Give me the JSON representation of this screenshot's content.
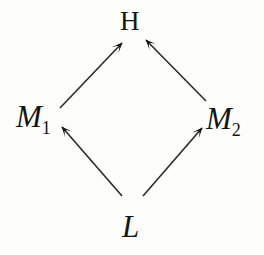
{
  "diagram": {
    "type": "lattice-hasse-diagram",
    "title": "",
    "background_color": "#fdfdfc",
    "ink_color": "#151515",
    "nodes": [
      {
        "id": "H",
        "base": "H",
        "subscript": "",
        "style": "upright",
        "x": 131,
        "y": 22,
        "role": "top"
      },
      {
        "id": "M1",
        "base": "M",
        "subscript": "1",
        "style": "italic",
        "x": 38,
        "y": 117,
        "role": "middle-left"
      },
      {
        "id": "M2",
        "base": "M",
        "subscript": "2",
        "style": "italic",
        "x": 228,
        "y": 119,
        "role": "middle-right"
      },
      {
        "id": "L",
        "base": "L",
        "subscript": "",
        "style": "italic",
        "x": 134,
        "y": 226,
        "role": "bottom"
      }
    ],
    "edges": [
      {
        "id": "m1-to-h",
        "from": "M1",
        "to": "H",
        "direction": "up-right",
        "x1": 60,
        "y1": 108,
        "x2": 122,
        "y2": 43
      },
      {
        "id": "m2-to-h",
        "from": "M2",
        "to": "H",
        "direction": "up-left",
        "x1": 206,
        "y1": 101,
        "x2": 146,
        "y2": 40
      },
      {
        "id": "l-to-m1",
        "from": "L",
        "to": "M1",
        "direction": "up-left",
        "x1": 122,
        "y1": 196,
        "x2": 62,
        "y2": 127
      },
      {
        "id": "l-to-m2",
        "from": "L",
        "to": "M2",
        "direction": "up-right",
        "x1": 143,
        "y1": 196,
        "x2": 202,
        "y2": 128
      }
    ],
    "arrowhead_style": "tex-barbed",
    "line_width": 1.6
  }
}
